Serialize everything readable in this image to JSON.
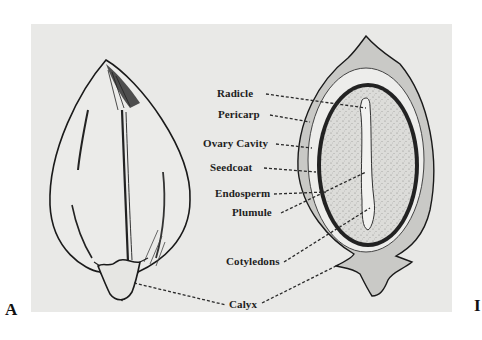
{
  "figure": {
    "panel_left_label": "A",
    "panel_right_label": "I",
    "colors": {
      "background": "#e9e9e7",
      "ink": "#1e1e1e",
      "page": "#ffffff"
    }
  },
  "labels": [
    {
      "id": "radicle",
      "text": "Radicle"
    },
    {
      "id": "pericarp",
      "text": "Pericarp"
    },
    {
      "id": "ovary-cavity",
      "text": "Ovary Cavity"
    },
    {
      "id": "seedcoat",
      "text": "Seedcoat"
    },
    {
      "id": "endosperm",
      "text": "Endosperm"
    },
    {
      "id": "plumule",
      "text": "Plumule"
    },
    {
      "id": "cotyledons",
      "text": "Cotyledons"
    },
    {
      "id": "calyx",
      "text": "Calyx"
    }
  ]
}
